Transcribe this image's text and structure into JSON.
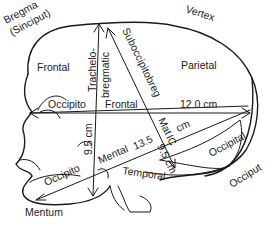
{
  "diagram": {
    "regions": {
      "bregma": "Bregma",
      "sinciput": "(Sinciput)",
      "vertex": "Vertex",
      "frontal_upper": "Frontal",
      "parietal": "Parietal",
      "occiput": "Occiput",
      "mentum": "Mentum",
      "temporal": "Temporal"
    },
    "diameters": {
      "occipitofrontal": {
        "part1": "Occipito",
        "part2": "Frontal",
        "value": "12.0 cm"
      },
      "trachelobregmatic": {
        "part1": "Trachelo-",
        "part2": "bregmatic",
        "value": "9.5 cm"
      },
      "suboccipitobregmatic": {
        "part1": "Suboccipitobreg",
        "part2": "Mat",
        "part3": "IC",
        "value": "9.5 cm"
      },
      "occipitomental": {
        "part1": "Occipito",
        "part2": "Mental",
        "value_num": "13.5",
        "value_unit": "cm",
        "end_label": "Occipital"
      }
    }
  }
}
